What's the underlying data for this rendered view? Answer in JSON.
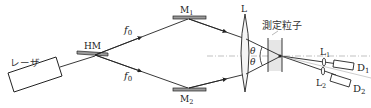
{
  "diagram": {
    "type": "optical-setup",
    "labels": {
      "laser": "レーザ",
      "half_mirror": "HM",
      "f0_upper": "f",
      "f0_upper_sub": "0",
      "f0_lower": "f",
      "f0_lower_sub": "0",
      "mirror1": "M",
      "mirror1_sub": "1",
      "mirror2": "M",
      "mirror2_sub": "2",
      "lens": "L",
      "theta_upper": "θ",
      "theta_lower": "θ",
      "particle": "測定粒子",
      "lens1": "L",
      "lens1_sub": "1",
      "lens2": "L",
      "lens2_sub": "2",
      "detector1": "D",
      "detector1_sub": "1",
      "detector2": "D",
      "detector2_sub": "2"
    },
    "colors": {
      "line": "#222222",
      "mirror_fill": "#9a9a9a",
      "dashed_axis": "#888888",
      "particle_region": "#e6e6e6"
    }
  }
}
